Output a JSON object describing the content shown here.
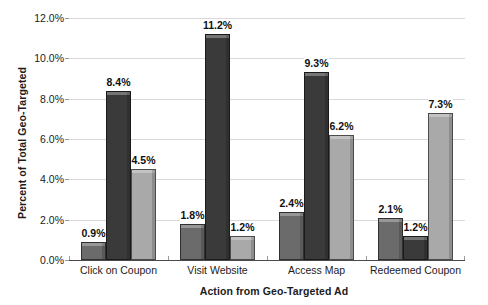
{
  "chart_data": {
    "type": "bar",
    "title": "",
    "xlabel": "Action from Geo-Targeted Ad",
    "ylabel": "Percent of Total Geo-Targeted",
    "ylim": [
      0,
      12
    ],
    "ytick_labels": [
      "0.0%",
      "2.0%",
      "4.0%",
      "6.0%",
      "8.0%",
      "10.0%",
      "12.0%"
    ],
    "ytick_values": [
      0,
      2,
      4,
      6,
      8,
      10,
      12
    ],
    "grid": true,
    "legend": "none",
    "categories": [
      "Click on Coupon",
      "Visit Website",
      "Access Map",
      "Redeemed Coupon"
    ],
    "series": [
      {
        "name": "series-1",
        "color": "#6b6b6b",
        "values": [
          0.9,
          1.8,
          2.4,
          2.1
        ],
        "labels": [
          "0.9%",
          "1.8%",
          "2.4%",
          "2.1%"
        ]
      },
      {
        "name": "series-2",
        "color": "#3a3a3a",
        "values": [
          8.4,
          11.2,
          9.3,
          1.2
        ],
        "labels": [
          "8.4%",
          "11.2%",
          "9.3%",
          "1.2%"
        ]
      },
      {
        "name": "series-3",
        "color": "#a9a9a9",
        "values": [
          4.5,
          1.2,
          6.2,
          7.3
        ],
        "labels": [
          "4.5%",
          "1.2%",
          "6.2%",
          "7.3%"
        ]
      }
    ]
  }
}
